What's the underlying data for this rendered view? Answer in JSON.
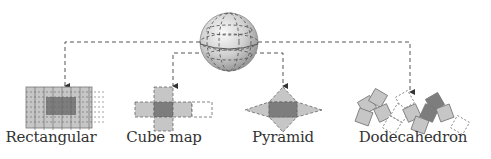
{
  "diagram": {
    "source": {
      "name": "sphere",
      "label": ""
    },
    "projections": [
      {
        "id": "rectangular",
        "label": "Rectangular"
      },
      {
        "id": "cube-map",
        "label": "Cube map"
      },
      {
        "id": "pyramid",
        "label": "Pyramid"
      },
      {
        "id": "dodecahedron",
        "label": "Dodecahedron"
      }
    ],
    "colors": {
      "light_face": "#c2c2c2",
      "dark_face": "#7a7a7a",
      "dashed_line": "#444444",
      "sphere_light": "#f2f2f2",
      "sphere_dark": "#9a9a9a",
      "text": "#333333"
    }
  }
}
